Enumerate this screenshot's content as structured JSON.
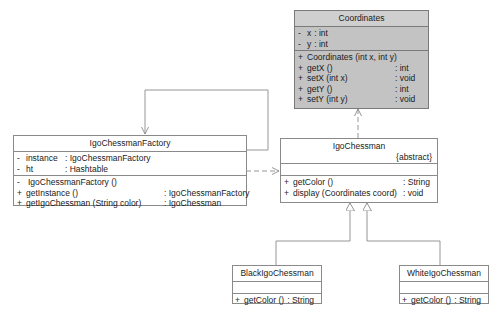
{
  "diagram_type": "UML class diagram",
  "classes": {
    "coordinates": {
      "name": "Coordinates",
      "attributes": [
        {
          "vis": "-",
          "name": "x",
          "type": ": int"
        },
        {
          "vis": "-",
          "name": "y",
          "type": ": int"
        }
      ],
      "operations": [
        {
          "vis": "+",
          "name": "Coordinates (int x, int y)",
          "type": ""
        },
        {
          "vis": "+",
          "name": "getX ()",
          "type": ": int"
        },
        {
          "vis": "+",
          "name": "setX (int x)",
          "type": ": void"
        },
        {
          "vis": "+",
          "name": "getY ()",
          "type": ": int"
        },
        {
          "vis": "+",
          "name": "setY (int y)",
          "type": ": void"
        }
      ]
    },
    "factory": {
      "name": "IgoChessmanFactory",
      "attributes": [
        {
          "vis": "-",
          "name": "instance",
          "type": ": IgoChessmanFactory"
        },
        {
          "vis": "-",
          "name": "ht",
          "type": ": Hashtable"
        }
      ],
      "operations": [
        {
          "vis": "-",
          "name": "IgoChessmanFactory ()",
          "type": ""
        },
        {
          "vis": "+",
          "name": "getInstance ()",
          "type": ": IgoChessmanFactory"
        },
        {
          "vis": "+",
          "name": "getIgoChessman (String color)",
          "type": ": IgoChessman"
        }
      ]
    },
    "chessman": {
      "name": "IgoChessman",
      "stereotype": "{abstract}",
      "attributes": [],
      "operations": [
        {
          "vis": "+",
          "name": "getColor ()",
          "type": ": String"
        },
        {
          "vis": "+",
          "name": "display (Coordinates coord)",
          "type": ": void"
        }
      ]
    },
    "black": {
      "name": "BlackIgoChessman",
      "attributes": [],
      "operations": [
        {
          "vis": "+",
          "name": "getColor ()",
          "type": ": String"
        }
      ]
    },
    "white": {
      "name": "WhiteIgoChessman",
      "attributes": [],
      "operations": [
        {
          "vis": "+",
          "name": "getColor ()",
          "type": ": String"
        }
      ]
    }
  },
  "relationships": [
    {
      "type": "association",
      "from": "IgoChessmanFactory",
      "to": "IgoChessmanFactory",
      "label": "self-association (instance)"
    },
    {
      "type": "dependency",
      "from": "IgoChessmanFactory",
      "to": "IgoChessman"
    },
    {
      "type": "dependency",
      "from": "IgoChessman",
      "to": "Coordinates"
    },
    {
      "type": "generalization",
      "from": "BlackIgoChessman",
      "to": "IgoChessman"
    },
    {
      "type": "generalization",
      "from": "WhiteIgoChessman",
      "to": "IgoChessman"
    }
  ],
  "colors": {
    "gray_class_fill": "#c3c3c3",
    "class_fill": "#ffffff",
    "border": "#8a8a8a",
    "line": "#8a8a8a"
  }
}
